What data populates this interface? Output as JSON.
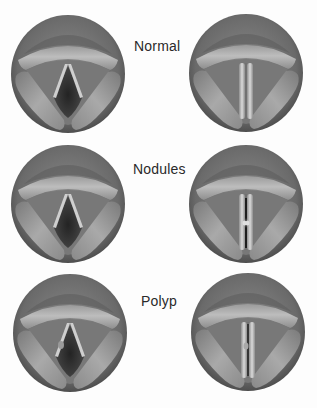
{
  "figure": {
    "rows": [
      {
        "label": "Normal",
        "open_view": "open-glottis",
        "closed_view": "closed-glottis",
        "lesion": "none"
      },
      {
        "label": "Nodules",
        "open_view": "open-glottis",
        "closed_view": "closed-glottis-with-nodules",
        "lesion": "nodules"
      },
      {
        "label": "Polyp",
        "open_view": "open-glottis-with-polyp",
        "closed_view": "closed-glottis-with-polyp",
        "lesion": "polyp"
      }
    ]
  },
  "colors": {
    "background": "#fdfdfd",
    "rim": "#5a5a5a",
    "tissue_dark": "#6e6e6e",
    "tissue_mid": "#8c8c8c",
    "tissue_light": "#b4b4b4",
    "fold_highlight": "#d2d2d2",
    "airway": "#2e2e2e",
    "label_text": "#2a2a2a"
  }
}
